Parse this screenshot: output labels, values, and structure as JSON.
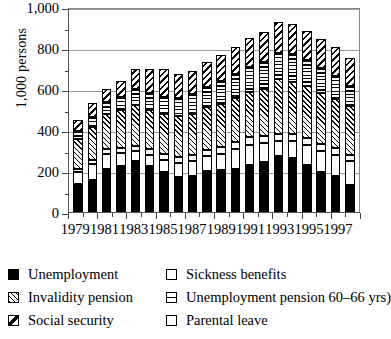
{
  "chart_data": {
    "type": "bar",
    "subtype": "stacked",
    "title": "",
    "xlabel": "",
    "ylabel": "1,000 persons",
    "ylim": [
      0,
      1000
    ],
    "ytick_values": [
      0,
      200,
      400,
      600,
      800,
      1000
    ],
    "ytick_labels": [
      "0",
      "200",
      "400",
      "600",
      "800",
      "1,000"
    ],
    "yminor_values": [
      100,
      300,
      500,
      700,
      900
    ],
    "grid": true,
    "grid_axis": "y",
    "legend_position": "below",
    "categories": [
      "1979",
      "1980",
      "1981",
      "1982",
      "1983",
      "1984",
      "1985",
      "1986",
      "1987",
      "1988",
      "1989",
      "1990",
      "1991",
      "1992",
      "1993",
      "1994",
      "1995",
      "1996",
      "1997",
      "1998"
    ],
    "xtick_labels": [
      "1979",
      "1981",
      "1983",
      "1985",
      "1987",
      "1989",
      "1991",
      "1993",
      "1995",
      "1997"
    ],
    "series": [
      {
        "name": "Unemployment",
        "pattern": "solid-black",
        "color": "#000000",
        "values": [
          135,
          155,
          210,
          225,
          250,
          225,
          195,
          170,
          175,
          198,
          205,
          210,
          228,
          245,
          272,
          265,
          228,
          195,
          175,
          130
        ]
      },
      {
        "name": "Sickness benefits",
        "pattern": "white-open",
        "color": "#ffffff",
        "values": [
          60,
          80,
          75,
          65,
          50,
          55,
          60,
          70,
          75,
          75,
          80,
          95,
          100,
          90,
          75,
          80,
          100,
          105,
          105,
          120
        ]
      },
      {
        "name": "Parental leave",
        "pattern": "white-open",
        "color": "#ffffff",
        "values": [
          15,
          18,
          20,
          22,
          24,
          25,
          26,
          28,
          30,
          32,
          33,
          35,
          36,
          36,
          35,
          35,
          35,
          33,
          32,
          30
        ]
      },
      {
        "name": "Invalidity pension",
        "pattern": "diagonal-forward-hatch",
        "color": "#ffffff",
        "values": [
          145,
          160,
          175,
          185,
          200,
          195,
          195,
          200,
          200,
          205,
          210,
          215,
          220,
          230,
          265,
          255,
          250,
          250,
          240,
          235
        ]
      },
      {
        "name": "Unemployment pension 60–66 yrs",
        "pattern": "horizontal-lines",
        "color": "#ffffff",
        "values": [
          40,
          50,
          55,
          65,
          75,
          80,
          85,
          90,
          95,
          100,
          110,
          120,
          125,
          130,
          130,
          135,
          130,
          120,
          110,
          100
        ]
      },
      {
        "name": "Social security",
        "pattern": "diagonal-backslash",
        "color": "#ffffff",
        "values": [
          55,
          70,
          65,
          75,
          100,
          120,
          135,
          115,
          115,
          120,
          130,
          130,
          140,
          145,
          150,
          145,
          140,
          140,
          145,
          135
        ]
      }
    ]
  },
  "legend": {
    "items": [
      {
        "label": "Unemployment",
        "swatch": "solid-black-swatch"
      },
      {
        "label": "Sickness benefits",
        "swatch": "white-open-swatch"
      },
      {
        "label": "Invalidity pension",
        "swatch": "diagonal-hatch-swatch"
      },
      {
        "label": "Unemployment pension 60–66 yrs)",
        "swatch": "horizontal-line-swatch"
      },
      {
        "label": "Social security",
        "swatch": "backslash-swatch"
      },
      {
        "label": "Parental leave",
        "swatch": "white-open-swatch"
      }
    ]
  }
}
